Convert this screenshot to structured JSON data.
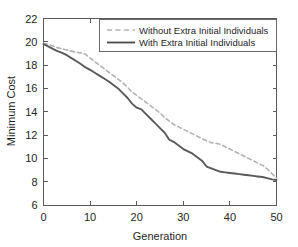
{
  "chart_data": {
    "type": "line",
    "title": "",
    "xlabel": "Generation",
    "ylabel": "Minimum Cost",
    "xlim": [
      0,
      50
    ],
    "ylim": [
      6,
      22
    ],
    "xticks": [
      0,
      10,
      20,
      30,
      40,
      50
    ],
    "yticks": [
      6,
      8,
      10,
      12,
      14,
      16,
      18,
      20,
      22
    ],
    "xtick_labels": [
      "0",
      "10",
      "20",
      "30",
      "40",
      "50"
    ],
    "ytick_labels": [
      "6",
      "8",
      "10",
      "12",
      "14",
      "16",
      "18",
      "20",
      "22"
    ],
    "grid": false,
    "legend_position": "top-right",
    "x": [
      0,
      1,
      2,
      3,
      4,
      5,
      6,
      7,
      8,
      9,
      10,
      11,
      12,
      13,
      14,
      15,
      16,
      17,
      18,
      19,
      20,
      21,
      22,
      23,
      24,
      25,
      26,
      27,
      28,
      29,
      30,
      31,
      32,
      33,
      34,
      35,
      36,
      37,
      38,
      39,
      40,
      41,
      42,
      43,
      44,
      45,
      46,
      47,
      48,
      49,
      50
    ],
    "series": [
      {
        "name": "Without Extra Initial Individuals",
        "style": "dashed",
        "color": "#b3b3b3",
        "values": [
          19.85,
          19.8,
          19.65,
          19.5,
          19.4,
          19.3,
          19.2,
          19.1,
          19.05,
          18.95,
          18.6,
          18.3,
          18.0,
          17.7,
          17.4,
          17.1,
          16.8,
          16.5,
          16.1,
          15.7,
          15.4,
          15.1,
          14.8,
          14.5,
          14.2,
          13.9,
          13.5,
          13.2,
          12.9,
          12.7,
          12.5,
          12.3,
          12.1,
          11.9,
          11.7,
          11.5,
          11.35,
          11.3,
          11.2,
          11.0,
          10.8,
          10.6,
          10.4,
          10.2,
          10.0,
          9.8,
          9.6,
          9.4,
          9.1,
          8.7,
          8.3
        ]
      },
      {
        "name": "With Extra Initial Individuals",
        "style": "solid",
        "color": "#595959",
        "values": [
          19.8,
          19.6,
          19.4,
          19.2,
          19.05,
          18.85,
          18.6,
          18.35,
          18.1,
          17.8,
          17.6,
          17.35,
          17.1,
          16.85,
          16.6,
          16.3,
          16.0,
          15.6,
          15.2,
          14.7,
          14.35,
          14.2,
          13.8,
          13.4,
          13.0,
          12.6,
          12.2,
          11.6,
          11.4,
          11.1,
          10.8,
          10.6,
          10.4,
          10.1,
          9.8,
          9.3,
          9.15,
          9.0,
          8.85,
          8.8,
          8.75,
          8.7,
          8.65,
          8.6,
          8.55,
          8.5,
          8.45,
          8.4,
          8.3,
          8.2,
          8.15
        ]
      }
    ]
  },
  "legend": {
    "entries": [
      {
        "label": "Without Extra Initial Individuals"
      },
      {
        "label": "With Extra Initial Individuals"
      }
    ]
  },
  "axes": {
    "x_title": "Generation",
    "y_title": "Minimum Cost"
  }
}
